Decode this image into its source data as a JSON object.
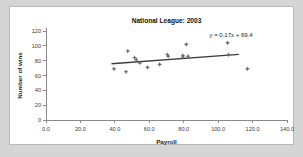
{
  "window": {
    "background_color": "#d5d5d5",
    "panel_color": "#ffffff",
    "panel_border_color": "#b9b9b9"
  },
  "chart_data": {
    "type": "scatter",
    "title": "National League: 2003",
    "xlabel": "Payroll",
    "ylabel": "Number of wins",
    "xlim": [
      0.0,
      140.0
    ],
    "ylim": [
      0,
      120
    ],
    "xticks": [
      "0.0",
      "20.0",
      "40.0",
      "60.0",
      "80.0",
      "100.0",
      "120.0",
      "140.0"
    ],
    "yticks": [
      "0",
      "20",
      "40",
      "60",
      "80",
      "100",
      "120"
    ],
    "grid": false,
    "legend": false,
    "marker_color": "#6e6e6e",
    "trendline_color": "#3c3c3c",
    "annotation": "y = 0.17x + 69.4",
    "trendline": {
      "slope": 0.17,
      "intercept": 69.4,
      "x_start": 38.0,
      "x_end": 112.0
    },
    "points": [
      {
        "x": 39.5,
        "y": 69
      },
      {
        "x": 46.5,
        "y": 65
      },
      {
        "x": 47.5,
        "y": 93
      },
      {
        "x": 51.5,
        "y": 84
      },
      {
        "x": 52.5,
        "y": 81
      },
      {
        "x": 54.5,
        "y": 77
      },
      {
        "x": 59.0,
        "y": 71
      },
      {
        "x": 66.0,
        "y": 75
      },
      {
        "x": 70.5,
        "y": 88
      },
      {
        "x": 71.0,
        "y": 86
      },
      {
        "x": 79.5,
        "y": 87
      },
      {
        "x": 79.5,
        "y": 85
      },
      {
        "x": 82.5,
        "y": 86
      },
      {
        "x": 81.5,
        "y": 102
      },
      {
        "x": 105.5,
        "y": 104
      },
      {
        "x": 106.0,
        "y": 88
      },
      {
        "x": 117.0,
        "y": 69
      }
    ]
  }
}
